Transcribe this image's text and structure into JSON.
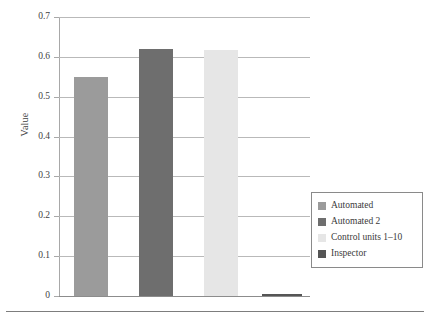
{
  "chart_data": {
    "type": "bar",
    "title": "",
    "xlabel": "",
    "ylabel": "Value",
    "ylim": [
      0,
      0.7
    ],
    "ytick_labels": [
      "0.7",
      "0.6",
      "0.5",
      "0.4",
      "0.3",
      "0.2",
      "0.1",
      "0"
    ],
    "ytick_values": [
      0.7,
      0.6,
      0.5,
      0.4,
      0.3,
      0.2,
      0.1,
      0
    ],
    "grid": true,
    "legend_position": "right",
    "categories": [
      "Automated",
      "Automated 2",
      "Control units 1–10",
      "Inspector"
    ],
    "values": [
      0.55,
      0.62,
      0.617,
      0.005
    ],
    "colors": [
      "#9b9b9b",
      "#6e6e6e",
      "#e6e6e6",
      "#555555"
    ],
    "series": [
      {
        "name": "Automated",
        "value": 0.55,
        "color": "#9b9b9b"
      },
      {
        "name": "Automated 2",
        "value": 0.62,
        "color": "#6e6e6e"
      },
      {
        "name": "Control units 1–10",
        "value": 0.617,
        "color": "#e6e6e6"
      },
      {
        "name": "Inspector",
        "value": 0.005,
        "color": "#555555"
      }
    ]
  },
  "axes": {
    "y_title": "Value",
    "ticks": [
      {
        "label": "0.7",
        "value": 0.7
      },
      {
        "label": "0.6",
        "value": 0.6
      },
      {
        "label": "0.5",
        "value": 0.5
      },
      {
        "label": "0.4",
        "value": 0.4
      },
      {
        "label": "0.3",
        "value": 0.3
      },
      {
        "label": "0.2",
        "value": 0.2
      },
      {
        "label": "0.1",
        "value": 0.1
      },
      {
        "label": "0",
        "value": 0
      }
    ]
  },
  "legend": {
    "items": [
      {
        "label": "Automated",
        "color": "#9b9b9b"
      },
      {
        "label": "Automated 2",
        "color": "#6e6e6e"
      },
      {
        "label": "Control units 1–10",
        "color": "#e6e6e6"
      },
      {
        "label": "Inspector",
        "color": "#555555"
      }
    ]
  }
}
